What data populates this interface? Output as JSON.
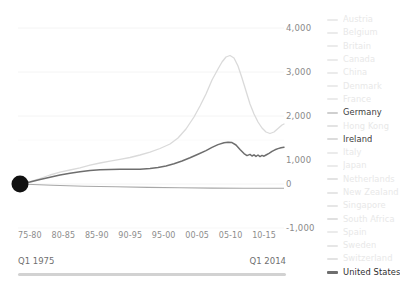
{
  "chart_data": {
    "type": "line",
    "title": "",
    "xlabel": "",
    "ylabel": "",
    "grid": true,
    "legend_position": "right",
    "ylim": [
      -1000,
      4000
    ],
    "y_ticks": [
      "4,000",
      "3,000",
      "2,000",
      "1,000",
      "0",
      "-1,000"
    ],
    "y_tick_values": [
      4000,
      3000,
      2000,
      1000,
      0,
      -1000
    ],
    "x_ticks": [
      "75-80",
      "80-85",
      "85-90",
      "90-95",
      "95-00",
      "00-05",
      "05-10",
      "10-15"
    ],
    "x_range_start": "Q1 1975",
    "x_range_end": "Q1 2014",
    "origin_marker": {
      "label": "",
      "x": 1975,
      "y": 0
    },
    "series": [
      {
        "name": "Ireland",
        "color": "#d8d8d8",
        "highlighted": true,
        "x": [
          1975,
          1977,
          1979,
          1981,
          1983,
          1985,
          1987,
          1989,
          1991,
          1993,
          1995,
          1997,
          1999,
          2001,
          2003,
          2005,
          2006,
          2007,
          2008,
          2009,
          2010,
          2011,
          2012,
          2013,
          2014
        ],
        "values": [
          0,
          60,
          130,
          200,
          250,
          300,
          360,
          420,
          470,
          520,
          600,
          700,
          820,
          980,
          1250,
          1750,
          2100,
          2500,
          2950,
          3280,
          3050,
          2500,
          1950,
          1550,
          1700
        ]
      },
      {
        "name": "United States",
        "color": "#6e6e6e",
        "highlighted": true,
        "x": [
          1975,
          1977,
          1979,
          1981,
          1983,
          1985,
          1987,
          1989,
          1991,
          1993,
          1995,
          1997,
          1999,
          2001,
          2003,
          2005,
          2006,
          2007,
          2008,
          2009,
          2010,
          2011,
          2012,
          2013,
          2014
        ],
        "values": [
          0,
          45,
          105,
          170,
          215,
          265,
          300,
          330,
          340,
          345,
          360,
          400,
          450,
          510,
          600,
          730,
          840,
          950,
          1010,
          960,
          700,
          690,
          660,
          700,
          790
        ]
      },
      {
        "name": "Germany",
        "color": "#9a9a9a",
        "highlighted": true,
        "x": [
          1975,
          1980,
          1985,
          1990,
          1995,
          2000,
          2005,
          2010,
          2014
        ],
        "values": [
          0,
          -30,
          -55,
          -70,
          -80,
          -85,
          -90,
          -95,
          -95
        ]
      }
    ]
  },
  "legend": {
    "items": [
      {
        "label": "Austria",
        "color": "#ebebeb",
        "highlighted": false
      },
      {
        "label": "Belgium",
        "color": "#ebebeb",
        "highlighted": false
      },
      {
        "label": "Britain",
        "color": "#ebebeb",
        "highlighted": false
      },
      {
        "label": "Canada",
        "color": "#ebebeb",
        "highlighted": false
      },
      {
        "label": "China",
        "color": "#ebebeb",
        "highlighted": false
      },
      {
        "label": "Denmark",
        "color": "#ebebeb",
        "highlighted": false
      },
      {
        "label": "France",
        "color": "#ebebeb",
        "highlighted": false
      },
      {
        "label": "Germany",
        "color": "#cfcfcf",
        "highlighted": true
      },
      {
        "label": "Hong Kong",
        "color": "#e3e3e3",
        "highlighted": false
      },
      {
        "label": "Ireland",
        "color": "#dcdcdc",
        "highlighted": true
      },
      {
        "label": "Italy",
        "color": "#ebebeb",
        "highlighted": false
      },
      {
        "label": "Japan",
        "color": "#ebebeb",
        "highlighted": false
      },
      {
        "label": "Netherlands",
        "color": "#e3e3e3",
        "highlighted": false
      },
      {
        "label": "New Zealand",
        "color": "#e6e6e6",
        "highlighted": false
      },
      {
        "label": "Singapore",
        "color": "#e6e6e6",
        "highlighted": false
      },
      {
        "label": "South Africa",
        "color": "#e0e0e0",
        "highlighted": false
      },
      {
        "label": "Spain",
        "color": "#ebebeb",
        "highlighted": false
      },
      {
        "label": "Sweden",
        "color": "#e6e6e6",
        "highlighted": false
      },
      {
        "label": "Switzerland",
        "color": "#e3e3e3",
        "highlighted": false
      },
      {
        "label": "United States",
        "color": "#6e6e6e",
        "highlighted": true
      }
    ]
  },
  "colors": {
    "axis_text": "#8a8a8a",
    "gridline": "#f4f4f4",
    "marker": "#111111",
    "slider_track": "#d2d2d2"
  }
}
